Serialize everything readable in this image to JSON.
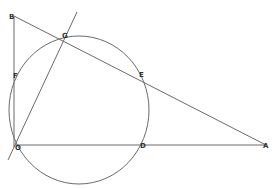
{
  "diagram": {
    "type": "geometry-figure",
    "colors": {
      "stroke": "#6a6a6a",
      "label": "#333333",
      "background": "#ffffff"
    },
    "points": {
      "B": {
        "label": "B",
        "x": 14,
        "y": 16
      },
      "G": {
        "label": "G",
        "x": 65,
        "y": 35
      },
      "F": {
        "label": "F",
        "x": 15,
        "y": 75
      },
      "O": {
        "label": "O",
        "x": 15,
        "y": 145
      },
      "E": {
        "label": "E",
        "x": 142,
        "y": 74
      },
      "D": {
        "label": "D",
        "x": 143,
        "y": 145
      },
      "A": {
        "label": "A",
        "x": 266,
        "y": 145
      }
    },
    "circle": {
      "cx": 79,
      "cy": 110,
      "rx": 70,
      "ry": 74
    },
    "segments": [
      {
        "from": "B",
        "to": "O"
      },
      {
        "from": "B",
        "to": "A"
      },
      {
        "from": "O",
        "to": "A"
      }
    ],
    "lines": [
      {
        "name": "line-OG",
        "x1": 8,
        "y1": 160,
        "x2": 77,
        "y2": 12
      }
    ]
  }
}
